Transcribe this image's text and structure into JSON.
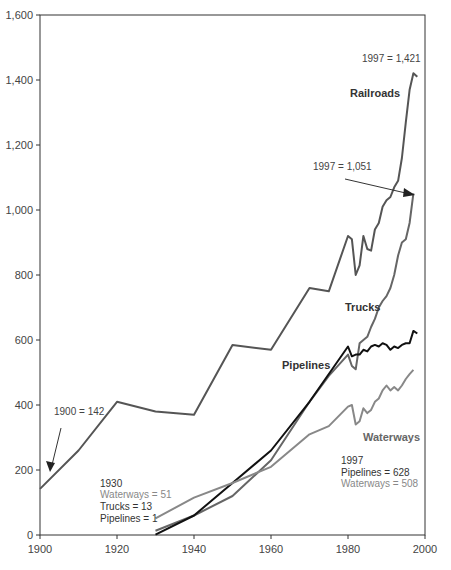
{
  "chart_data": {
    "type": "line",
    "title": "",
    "xlabel": "",
    "ylabel": "",
    "xlim": [
      1900,
      2000
    ],
    "ylim": [
      0,
      1600
    ],
    "x_ticks": [
      "1900",
      "1920",
      "1940",
      "1960",
      "1980",
      "2000"
    ],
    "y_ticks": [
      "0",
      "200",
      "400",
      "600",
      "800",
      "1,000",
      "1,200",
      "1,400",
      "1,600"
    ],
    "grid": false,
    "legend": "inline labels",
    "series": [
      {
        "name": "Railroads",
        "color": "#555555",
        "x": [
          1900,
          1910,
          1920,
          1930,
          1940,
          1950,
          1960,
          1970,
          1975,
          1980,
          1981,
          1982,
          1983,
          1984,
          1985,
          1986,
          1987,
          1988,
          1989,
          1990,
          1991,
          1992,
          1993,
          1994,
          1995,
          1996,
          1997,
          1998
        ],
        "values": [
          142,
          260,
          410,
          380,
          370,
          585,
          570,
          760,
          750,
          920,
          910,
          800,
          830,
          920,
          880,
          875,
          940,
          960,
          1010,
          1030,
          1040,
          1070,
          1090,
          1160,
          1270,
          1370,
          1421,
          1410
        ]
      },
      {
        "name": "Trucks",
        "color": "#666666",
        "x": [
          1930,
          1940,
          1950,
          1960,
          1970,
          1975,
          1980,
          1981,
          1982,
          1983,
          1984,
          1985,
          1986,
          1987,
          1988,
          1989,
          1990,
          1991,
          1992,
          1993,
          1994,
          1995,
          1996,
          1997
        ],
        "values": [
          13,
          60,
          120,
          230,
          410,
          490,
          555,
          520,
          510,
          590,
          600,
          610,
          640,
          665,
          700,
          720,
          735,
          760,
          800,
          860,
          900,
          910,
          960,
          1051
        ]
      },
      {
        "name": "Pipelines",
        "color": "#111111",
        "x": [
          1930,
          1940,
          1950,
          1960,
          1970,
          1980,
          1981,
          1982,
          1983,
          1984,
          1985,
          1986,
          1987,
          1988,
          1989,
          1990,
          1991,
          1992,
          1993,
          1994,
          1995,
          1996,
          1997,
          1998
        ],
        "values": [
          1,
          60,
          160,
          260,
          410,
          580,
          550,
          555,
          555,
          570,
          565,
          580,
          585,
          580,
          590,
          585,
          570,
          580,
          575,
          585,
          590,
          590,
          628,
          620
        ]
      },
      {
        "name": "Waterways",
        "color": "#888888",
        "x": [
          1930,
          1940,
          1950,
          1960,
          1970,
          1975,
          1980,
          1981,
          1982,
          1983,
          1984,
          1985,
          1986,
          1987,
          1988,
          1989,
          1990,
          1991,
          1992,
          1993,
          1994,
          1995,
          1996,
          1997
        ],
        "values": [
          51,
          115,
          160,
          210,
          310,
          335,
          395,
          400,
          340,
          350,
          390,
          375,
          385,
          410,
          420,
          445,
          460,
          445,
          455,
          445,
          460,
          480,
          495,
          508
        ]
      }
    ],
    "annotations": [
      {
        "text": "1997 = 1,421",
        "series": "Railroads"
      },
      {
        "text": "1997 = 1,051",
        "series": "Trucks"
      },
      {
        "text": "1900 = 142",
        "series": "Railroads"
      },
      {
        "text_lines": [
          "1930",
          "Waterways = 51",
          "Trucks = 13",
          "Pipelines = 1"
        ]
      },
      {
        "text_lines": [
          "1997",
          "Pipelines = 628",
          "Waterways = 508"
        ]
      }
    ]
  },
  "labels": {
    "railroads": "Railroads",
    "trucks": "Trucks",
    "pipelines": "Pipelines",
    "waterways": "Waterways",
    "rr_1997": "1997 = 1,421",
    "tr_1997": "1997 = 1,051",
    "rr_1900": "1900 = 142",
    "y1930": "1930",
    "ww_1930": "Waterways = 51",
    "tr_1930": "Trucks = 13",
    "pl_1930": "Pipelines = 1",
    "y1997": "1997",
    "pl_1997": "Pipelines = 628",
    "ww_1997": "Waterways = 508"
  }
}
